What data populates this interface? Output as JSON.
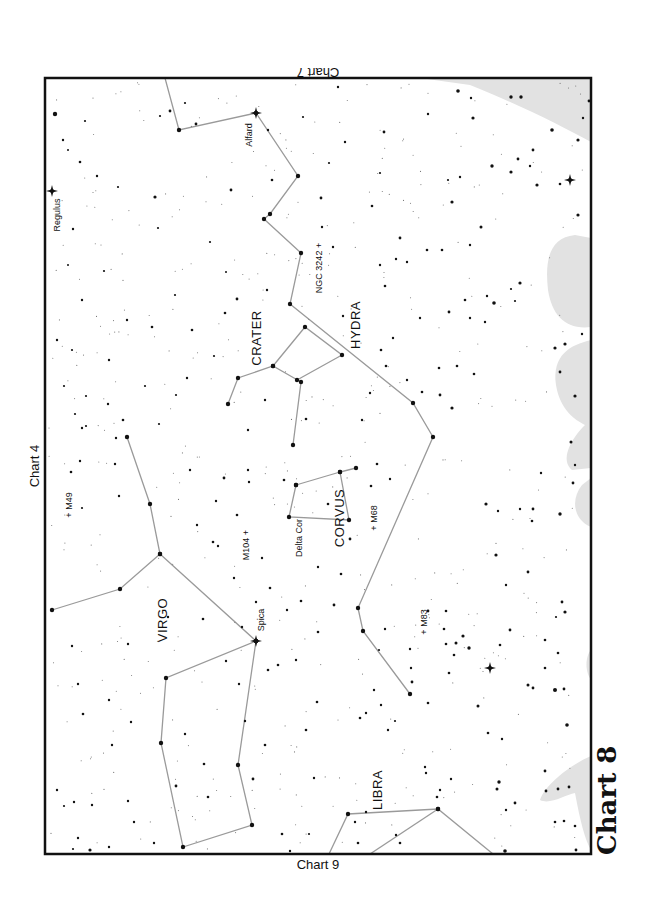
{
  "chart_title": "Chart 8",
  "adjacent_charts": {
    "top": "Chart 7",
    "left": "Chart 4",
    "bottom": "Chart 9"
  },
  "frame": {
    "x": 45,
    "y": 78,
    "w": 546,
    "h": 776
  },
  "colors": {
    "frame": "#111111",
    "lines": "#9a9a9a",
    "stars": "#111111",
    "milky_way": "#e2e2e2"
  },
  "constellations": [
    {
      "name": "HYDRA",
      "label_pos": [
        357,
        325
      ]
    },
    {
      "name": "CRATER",
      "label_pos": [
        258,
        338
      ]
    },
    {
      "name": "CORVUS",
      "label_pos": [
        341,
        518
      ]
    },
    {
      "name": "VIRGO",
      "label_pos": [
        164,
        620
      ]
    },
    {
      "name": "LIBRA",
      "label_pos": [
        379,
        790
      ]
    }
  ],
  "named_stars": [
    {
      "name": "Regulus",
      "pos": [
        52,
        191
      ],
      "label_pos": [
        58,
        215
      ]
    },
    {
      "name": "Alfard",
      "pos": [
        256,
        113
      ],
      "label_pos": [
        250,
        135
      ]
    },
    {
      "name": "Spica",
      "pos": [
        256,
        641
      ],
      "label_pos": [
        262,
        620
      ]
    },
    {
      "name": "Delta Cor",
      "pos": [
        289,
        517
      ],
      "label_pos": [
        300,
        538
      ]
    }
  ],
  "deep_sky_objects": [
    {
      "name": "NGC 3242",
      "label": "NGC 3242 +",
      "label_pos": [
        320,
        268
      ]
    },
    {
      "name": "M49",
      "label": "+ M49",
      "label_pos": [
        70,
        505
      ]
    },
    {
      "name": "M104",
      "label": "M104 +",
      "label_pos": [
        247,
        545
      ]
    },
    {
      "name": "M68",
      "label": "+ M68",
      "label_pos": [
        375,
        518
      ]
    },
    {
      "name": "M83",
      "label": "+ M83",
      "label_pos": [
        425,
        622
      ]
    }
  ],
  "lines": [
    [
      [
        165,
        78
      ],
      [
        179,
        130
      ],
      [
        256,
        113
      ],
      [
        298,
        176
      ],
      [
        270,
        214
      ],
      [
        264,
        219
      ],
      [
        301,
        253
      ],
      [
        290,
        304
      ],
      [
        413,
        403
      ],
      [
        433,
        437
      ],
      [
        358,
        608
      ],
      [
        363,
        631
      ],
      [
        410,
        694
      ]
    ],
    [
      [
        293,
        445
      ],
      [
        301,
        382
      ],
      [
        273,
        366
      ],
      [
        238,
        378
      ],
      [
        228,
        404
      ]
    ],
    [
      [
        273,
        366
      ],
      [
        305,
        327
      ],
      [
        342,
        355
      ],
      [
        297,
        380
      ]
    ],
    [
      [
        296,
        485
      ],
      [
        289,
        517
      ],
      [
        349,
        520
      ],
      [
        340,
        472
      ],
      [
        356,
        468
      ]
    ],
    [
      [
        340,
        472
      ],
      [
        296,
        485
      ]
    ],
    [
      [
        52,
        610
      ],
      [
        120,
        589
      ],
      [
        160,
        554
      ],
      [
        150,
        504
      ],
      [
        127,
        437
      ]
    ],
    [
      [
        160,
        554
      ],
      [
        256,
        641
      ],
      [
        166,
        678
      ],
      [
        161,
        743
      ],
      [
        183,
        847
      ],
      [
        252,
        825
      ],
      [
        238,
        765
      ],
      [
        256,
        641
      ]
    ],
    [
      [
        329,
        854
      ],
      [
        348,
        814
      ],
      [
        438,
        809
      ],
      [
        493,
        854
      ]
    ],
    [
      [
        370,
        854
      ],
      [
        438,
        809
      ]
    ]
  ],
  "milky_way_regions": [
    "M 420,78 L 591,78 L 591,142 C 560,125 520,105 470,85 Z",
    "M 591,238 L 575,235 C 548,238 545,262 548,290 C 552,315 565,330 591,327 Z",
    "M 591,340 C 570,345 552,355 556,385 C 560,410 575,420 585,425 C 570,440 560,460 572,470 L 591,468 Z",
    "M 591,478 L 582,485 C 570,500 574,520 591,527 Z",
    "M 591,650 C 586,655 584,670 591,680 Z",
    "M 591,756 C 570,765 545,785 540,800 C 550,805 565,795 575,793 C 580,820 585,840 591,850 Z"
  ],
  "bright_stars": [
    [
      52,
      191
    ],
    [
      256,
      113
    ],
    [
      256,
      641
    ],
    [
      570,
      180
    ],
    [
      490,
      668
    ]
  ],
  "stars": [
    [
      55,
      114,
      2.2
    ],
    [
      63,
      140,
      1.2
    ],
    [
      80,
      162,
      1.3
    ],
    [
      85,
      121,
      1.1
    ],
    [
      68,
      150,
      1
    ],
    [
      97,
      176,
      1.2
    ],
    [
      160,
      116,
      1.1
    ],
    [
      170,
      111,
      1.4
    ],
    [
      185,
      103,
      1.1
    ],
    [
      196,
      124,
      1.4
    ],
    [
      268,
      130,
      1.2
    ],
    [
      303,
      117,
      1.1
    ],
    [
      338,
      87,
      1.2
    ],
    [
      345,
      142,
      1.2
    ],
    [
      321,
      198,
      1.4
    ],
    [
      329,
      163,
      1.1
    ],
    [
      380,
      173,
      1.1
    ],
    [
      384,
      132,
      1.4
    ],
    [
      428,
      114,
      1.2
    ],
    [
      372,
      206,
      1.3
    ],
    [
      322,
      227,
      1.2
    ],
    [
      400,
      238,
      1.4
    ],
    [
      448,
      180,
      1.1
    ],
    [
      452,
      202,
      1.6
    ],
    [
      460,
      177,
      1.2
    ],
    [
      492,
      166,
      1.7
    ],
    [
      511,
      172,
      1.6
    ],
    [
      518,
      159,
      1.4
    ],
    [
      530,
      166,
      1.2
    ],
    [
      537,
      185,
      1.6
    ],
    [
      552,
      130,
      1.8
    ],
    [
      533,
      150,
      1.4
    ],
    [
      578,
      215,
      1.6
    ],
    [
      560,
      184,
      1.3
    ],
    [
      473,
      118,
      1.6
    ],
    [
      471,
      98,
      1.2
    ],
    [
      458,
      91,
      1.8
    ],
    [
      511,
      97,
      1.7
    ],
    [
      521,
      97,
      1.7
    ],
    [
      578,
      140,
      1.6
    ],
    [
      589,
      101,
      1.4
    ],
    [
      583,
      118,
      1.2
    ],
    [
      118,
      187,
      1.1
    ],
    [
      155,
      197,
      1.6
    ],
    [
      73,
      229,
      1.2
    ],
    [
      104,
      271,
      1.1
    ],
    [
      68,
      265,
      1
    ],
    [
      82,
      300,
      1.2
    ],
    [
      158,
      228,
      1.1
    ],
    [
      175,
      295,
      1.1
    ],
    [
      210,
      242,
      1.1
    ],
    [
      226,
      272,
      1
    ],
    [
      237,
      299,
      1.4
    ],
    [
      225,
      313,
      1.3
    ],
    [
      231,
      190,
      1.4
    ],
    [
      272,
      180,
      1.3
    ],
    [
      267,
      290,
      1.2
    ],
    [
      333,
      247,
      1.2
    ],
    [
      343,
      316,
      1.2
    ],
    [
      380,
      265,
      1.2
    ],
    [
      385,
      286,
      1.3
    ],
    [
      396,
      259,
      1.2
    ],
    [
      407,
      262,
      1.2
    ],
    [
      427,
      250,
      1.3
    ],
    [
      442,
      250,
      1.3
    ],
    [
      465,
      300,
      1.3
    ],
    [
      470,
      318,
      1.2
    ],
    [
      494,
      303,
      1.8
    ],
    [
      515,
      301,
      1.1
    ],
    [
      511,
      289,
      1.1
    ],
    [
      520,
      283,
      1.6
    ],
    [
      481,
      227,
      1.5
    ],
    [
      470,
      245,
      1.2
    ],
    [
      487,
      296,
      1.2
    ],
    [
      485,
      322,
      1.2
    ],
    [
      449,
      312,
      1.4
    ],
    [
      457,
      366,
      1.3
    ],
    [
      474,
      374,
      1.3
    ],
    [
      452,
      408,
      1.6
    ],
    [
      440,
      395,
      1.4
    ],
    [
      407,
      380,
      1.2
    ],
    [
      422,
      392,
      1.3
    ],
    [
      439,
      368,
      1.3
    ],
    [
      420,
      318,
      1.2
    ],
    [
      393,
      338,
      1.2
    ],
    [
      381,
      350,
      1.3
    ],
    [
      386,
      366,
      1.3
    ],
    [
      370,
      393,
      1.2
    ],
    [
      555,
      348,
      1.6
    ],
    [
      565,
      344,
      1.6
    ],
    [
      560,
      372,
      1.4
    ],
    [
      575,
      396,
      1.6
    ],
    [
      582,
      334,
      1.2
    ],
    [
      573,
      483,
      1.4
    ],
    [
      571,
      442,
      1.5
    ],
    [
      575,
      465,
      1.2
    ],
    [
      541,
      473,
      1.2
    ],
    [
      560,
      514,
      1.7
    ],
    [
      532,
      521,
      1.3
    ],
    [
      520,
      509,
      1.2
    ],
    [
      498,
      511,
      1.2
    ],
    [
      486,
      504,
      1.6
    ],
    [
      533,
      509,
      1.4
    ],
    [
      496,
      555,
      1.6
    ],
    [
      506,
      585,
      1.2
    ],
    [
      528,
      572,
      1.4
    ],
    [
      562,
      602,
      1.4
    ],
    [
      565,
      612,
      1.6
    ],
    [
      555,
      690,
      2
    ],
    [
      567,
      725,
      1.8
    ],
    [
      564,
      689,
      1.4
    ],
    [
      533,
      688,
      1.4
    ],
    [
      528,
      685,
      1.5
    ],
    [
      545,
      668,
      1.3
    ],
    [
      556,
      617,
      1.1
    ],
    [
      510,
      630,
      1.4
    ],
    [
      500,
      645,
      1.3
    ],
    [
      545,
      640,
      1.3
    ],
    [
      558,
      653,
      1.3
    ],
    [
      463,
      636,
      1.6
    ],
    [
      456,
      643,
      1.5
    ],
    [
      469,
      648,
      1.7
    ],
    [
      454,
      655,
      1.3
    ],
    [
      446,
      644,
      1.3
    ],
    [
      449,
      673,
      1.3
    ],
    [
      444,
      629,
      1.3
    ],
    [
      478,
      706,
      1.5
    ],
    [
      488,
      733,
      1.3
    ],
    [
      502,
      739,
      1.2
    ],
    [
      499,
      782,
      1.7
    ],
    [
      497,
      789,
      1.5
    ],
    [
      545,
      771,
      1.4
    ],
    [
      546,
      791,
      1.4
    ],
    [
      558,
      789,
      1.4
    ],
    [
      569,
      787,
      1.4
    ],
    [
      555,
      822,
      1.3
    ],
    [
      564,
      821,
      1.3
    ],
    [
      575,
      826,
      1.3
    ],
    [
      515,
      803,
      1.4
    ],
    [
      506,
      810,
      1.2
    ],
    [
      576,
      850,
      1.4
    ],
    [
      505,
      851,
      1.8
    ],
    [
      437,
      797,
      1.3
    ],
    [
      426,
      773,
      1.2
    ],
    [
      425,
      767,
      1.2
    ],
    [
      451,
      779,
      1.2
    ],
    [
      440,
      790,
      1.2
    ],
    [
      396,
      835,
      1.2
    ],
    [
      400,
      843,
      1.3
    ],
    [
      358,
      843,
      1.3
    ],
    [
      388,
      730,
      1.2
    ],
    [
      428,
      703,
      1.3
    ],
    [
      412,
      682,
      1.4
    ],
    [
      428,
      611,
      1.4
    ],
    [
      446,
      611,
      1.3
    ],
    [
      411,
      668,
      1.2
    ],
    [
      374,
      690,
      1.2
    ],
    [
      381,
      705,
      1.2
    ],
    [
      334,
      605,
      1.4
    ],
    [
      301,
      601,
      1.3
    ],
    [
      287,
      610,
      1.2
    ],
    [
      270,
      588,
      1.3
    ],
    [
      242,
      627,
      1.2
    ],
    [
      256,
      602,
      1.2
    ],
    [
      268,
      670,
      1.3
    ],
    [
      278,
      665,
      1.3
    ],
    [
      318,
      632,
      1.3
    ],
    [
      318,
      567,
      1.2
    ],
    [
      341,
      574,
      1.3
    ],
    [
      350,
      539,
      1.4
    ],
    [
      328,
      504,
      1.3
    ],
    [
      371,
      486,
      1.3
    ],
    [
      390,
      479,
      1.2
    ],
    [
      377,
      464,
      1.3
    ],
    [
      362,
      420,
      1.2
    ],
    [
      306,
      419,
      1.3
    ],
    [
      284,
      480,
      1.3
    ],
    [
      249,
      482,
      1.2
    ],
    [
      248,
      470,
      1.2
    ],
    [
      262,
      558,
      1.2
    ],
    [
      237,
      515,
      1.3
    ],
    [
      213,
      542,
      1.3
    ],
    [
      218,
      546,
      1.2
    ],
    [
      234,
      578,
      1.2
    ],
    [
      203,
      619,
      1.3
    ],
    [
      168,
      617,
      1.2
    ],
    [
      216,
      501,
      1.2
    ],
    [
      224,
      478,
      1.4
    ],
    [
      197,
      525,
      1.2
    ],
    [
      190,
      470,
      1.2
    ],
    [
      115,
      464,
      1.2
    ],
    [
      119,
      496,
      1.2
    ],
    [
      82,
      508,
      1.1
    ],
    [
      71,
      472,
      1.3
    ],
    [
      80,
      461,
      1.2
    ],
    [
      82,
      428,
      1.2
    ],
    [
      86,
      426,
      1.1
    ],
    [
      108,
      404,
      1.2
    ],
    [
      86,
      396,
      1.1
    ],
    [
      64,
      386,
      1.1
    ],
    [
      57,
      340,
      1.2
    ],
    [
      72,
      350,
      1.1
    ],
    [
      75,
      414,
      1.1
    ],
    [
      109,
      360,
      1.2
    ],
    [
      123,
      420,
      1.3
    ],
    [
      159,
      424,
      1.1
    ],
    [
      116,
      438,
      1.2
    ],
    [
      127,
      320,
      1.2
    ],
    [
      145,
      386,
      1.1
    ],
    [
      152,
      327,
      1.3
    ],
    [
      187,
      378,
      1.2
    ],
    [
      176,
      395,
      1.1
    ],
    [
      192,
      330,
      1.3
    ],
    [
      214,
      356,
      1.1
    ],
    [
      248,
      430,
      1.2
    ],
    [
      265,
      400,
      1.2
    ],
    [
      72,
      646,
      1.2
    ],
    [
      78,
      684,
      1.2
    ],
    [
      83,
      714,
      1.3
    ],
    [
      57,
      790,
      1.2
    ],
    [
      64,
      806,
      1.1
    ],
    [
      74,
      802,
      1.2
    ],
    [
      92,
      805,
      1.2
    ],
    [
      78,
      838,
      1.2
    ],
    [
      90,
      850,
      1.6
    ],
    [
      73,
      849,
      1.1
    ],
    [
      109,
      700,
      1.2
    ],
    [
      128,
      644,
      1.2
    ],
    [
      131,
      722,
      1.2
    ],
    [
      128,
      801,
      1.2
    ],
    [
      112,
      745,
      1.2
    ],
    [
      134,
      822,
      1.2
    ],
    [
      154,
      843,
      1.2
    ],
    [
      109,
      847,
      1.2
    ],
    [
      185,
      734,
      1.2
    ],
    [
      176,
      786,
      1.4
    ],
    [
      204,
      764,
      1.3
    ],
    [
      208,
      797,
      1.3
    ],
    [
      245,
      721,
      1.2
    ],
    [
      265,
      745,
      1.3
    ],
    [
      253,
      779,
      1.4
    ],
    [
      282,
      834,
      1.3
    ],
    [
      290,
      851,
      1.2
    ],
    [
      317,
      702,
      1.3
    ],
    [
      306,
      730,
      1.3
    ],
    [
      314,
      778,
      1.2
    ],
    [
      309,
      834,
      1.1
    ],
    [
      296,
      660,
      1.2
    ],
    [
      226,
      661,
      1.2
    ],
    [
      239,
      684,
      1.2
    ],
    [
      360,
      718,
      1.3
    ],
    [
      366,
      713,
      1.2
    ],
    [
      395,
      721,
      1.1
    ],
    [
      366,
      812,
      1.2
    ],
    [
      355,
      822,
      1.2
    ],
    [
      410,
      649,
      1.2
    ],
    [
      385,
      629,
      1.2
    ],
    [
      379,
      650,
      1.1
    ]
  ]
}
